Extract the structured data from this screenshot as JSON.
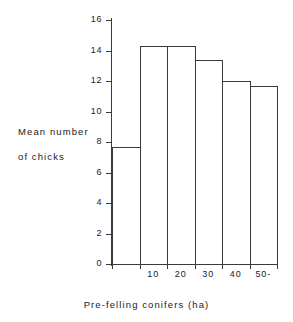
{
  "chart_data": {
    "type": "bar",
    "title": "",
    "subtitle": "",
    "xlabel": "Pre-felling conifers (ha)",
    "ylabel_line1": "Mean number",
    "ylabel_line2": "of chicks",
    "categories": [
      "",
      "10",
      "20",
      "30",
      "40",
      "50-"
    ],
    "values": [
      7.7,
      14.3,
      14.3,
      13.4,
      12.0,
      11.7
    ],
    "x_tick_labels": [
      "10",
      "20",
      "30",
      "40",
      "50-"
    ],
    "y_tick_labels": [
      "0",
      "2",
      "4",
      "6",
      "8",
      "10",
      "12",
      "14",
      "16"
    ],
    "y_ticks": [
      0,
      2,
      4,
      6,
      8,
      10,
      12,
      14,
      16
    ],
    "ylim": [
      0,
      16
    ],
    "grid": false,
    "legend": null,
    "legend_position": "none",
    "bar_fill_color": "#ffffff",
    "bar_edge_color": "#3a3a3a",
    "axis_color": "#3a3a3a",
    "background_color": "#ffffff",
    "text_color": "#1a1a1a"
  }
}
